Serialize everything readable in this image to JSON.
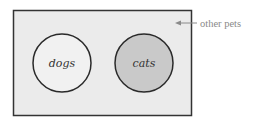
{
  "diagram": {
    "type": "venn",
    "universe": {
      "label": "other pets",
      "fill": "#ebebeb",
      "stroke": "#333333"
    },
    "sets": [
      {
        "label": "dogs",
        "fill": "#f1f1f1",
        "stroke": "#2a2a2a"
      },
      {
        "label": "cats",
        "fill": "#c9c9c9",
        "stroke": "#2a2a2a"
      }
    ],
    "arrow_color": "#8a8a8a"
  }
}
